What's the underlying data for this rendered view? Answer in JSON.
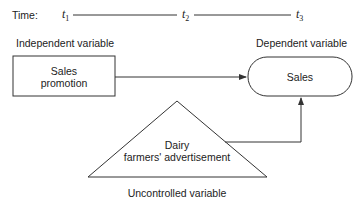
{
  "timeline": {
    "label": "Time:",
    "points": [
      {
        "symbol": "t",
        "index": "1"
      },
      {
        "symbol": "t",
        "index": "2"
      },
      {
        "symbol": "t",
        "index": "3"
      }
    ]
  },
  "headings": {
    "independent": "Independent variable",
    "dependent": "Dependent variable",
    "uncontrolled": "Uncontrolled variable"
  },
  "nodes": {
    "sales_promotion": {
      "line1": "Sales",
      "line2": "promotion"
    },
    "sales": {
      "label": "Sales"
    },
    "dairy": {
      "line1": "Dairy",
      "line2": "farmers' advertisement"
    }
  },
  "colors": {
    "stroke": "#333333",
    "text": "#222222",
    "background": "#ffffff"
  }
}
